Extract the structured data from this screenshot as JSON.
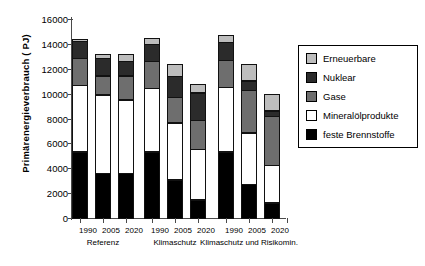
{
  "chart_data": {
    "type": "bar",
    "subtype": "stacked",
    "title": "",
    "xlabel": "",
    "ylabel": "Primärenergieverbrauch ( PJ)",
    "ylim": [
      0,
      16000
    ],
    "ytick_labels": [
      "16000",
      "14000",
      "12000",
      "10000",
      "8000",
      "6000",
      "4000",
      "2000",
      "0"
    ],
    "ytick_values": [
      16000,
      14000,
      12000,
      10000,
      8000,
      6000,
      4000,
      2000,
      0
    ],
    "grid": false,
    "legend_position": "right",
    "categories": [
      "1990",
      "2005",
      "2020",
      "1990",
      "2005",
      "2020",
      "1990",
      "2005",
      "2020"
    ],
    "groups": [
      {
        "label": "Referenz",
        "categories": [
          "1990",
          "2005",
          "2020"
        ]
      },
      {
        "label": "Klimaschutz",
        "categories": [
          "1990",
          "2005",
          "2020"
        ]
      },
      {
        "label": "Klimaschutz und Risikomin.",
        "categories": [
          "1990",
          "2005",
          "2020"
        ]
      }
    ],
    "series": [
      {
        "name": "feste Brennstoffe",
        "color": "#000000",
        "values": [
          5400,
          3700,
          3700,
          5400,
          3150,
          1550,
          5400,
          2800,
          1300
        ]
      },
      {
        "name": "Mineralölprodukte",
        "color": "#ffffff",
        "values": [
          5400,
          6350,
          5950,
          5150,
          4650,
          4150,
          5250,
          4200,
          3100
        ]
      },
      {
        "name": "Gase",
        "color": "#6e6e6e",
        "values": [
          2250,
          1600,
          2000,
          2250,
          2100,
          2350,
          2250,
          3500,
          4000
        ]
      },
      {
        "name": "Nuklear",
        "color": "#2b2b2b",
        "values": [
          1450,
          1450,
          1250,
          1450,
          1800,
          2300,
          1500,
          800,
          500
        ]
      },
      {
        "name": "Erneuerbare",
        "color": "#bdbdbd",
        "values": [
          250,
          400,
          600,
          550,
          1000,
          750,
          600,
          1400,
          1400
        ]
      }
    ],
    "totals": [
      14750,
      13500,
      13500,
      14800,
      12700,
      11100,
      15000,
      12700,
      10300
    ]
  },
  "legend": {
    "items": [
      {
        "label": "Erneuerbare",
        "color": "#bdbdbd"
      },
      {
        "label": "Nuklear",
        "color": "#2b2b2b"
      },
      {
        "label": "Gase",
        "color": "#6e6e6e"
      },
      {
        "label": "Mineralölprodukte",
        "color": "#ffffff"
      },
      {
        "label": "feste Brennstoffe",
        "color": "#000000"
      }
    ]
  }
}
